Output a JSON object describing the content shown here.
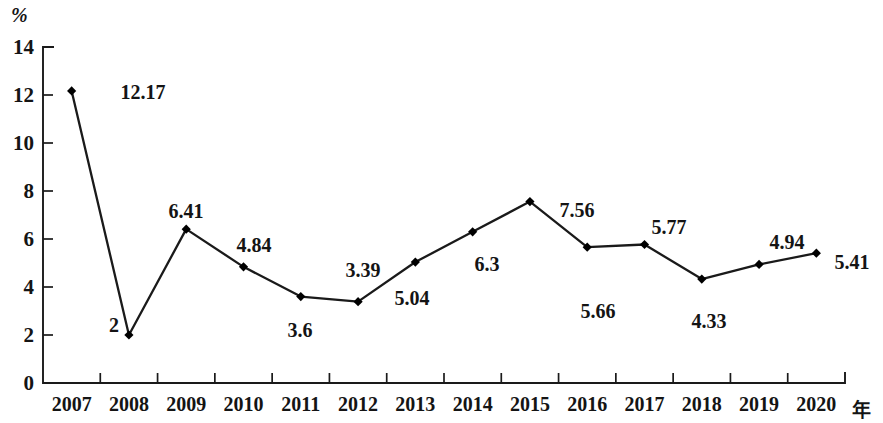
{
  "axes": {
    "y_unit_label": "%",
    "x_axis_name": "年",
    "y_ticks": [
      "0",
      "2",
      "4",
      "6",
      "8",
      "10",
      "12",
      "14"
    ],
    "x_ticks": [
      "2007",
      "2008",
      "2009",
      "2010",
      "2011",
      "2012",
      "2013",
      "2014",
      "2015",
      "2016",
      "2017",
      "2018",
      "2019",
      "2020"
    ]
  },
  "colors": {
    "line": "#1a1a1a",
    "marker": "#000000",
    "axis": "#1a1a1a",
    "text": "#141414",
    "background": "#ffffff"
  },
  "chart_data": {
    "type": "line",
    "title": "",
    "subtitle": "",
    "xlabel": "年",
    "ylabel": "%",
    "xlim": [
      "2007",
      "2020"
    ],
    "ylim": [
      0,
      14
    ],
    "ytick_step": 2,
    "grid": false,
    "legend": false,
    "marker": "diamond",
    "categories": [
      "2007",
      "2008",
      "2009",
      "2010",
      "2011",
      "2012",
      "2013",
      "2014",
      "2015",
      "2016",
      "2017",
      "2018",
      "2019",
      "2020"
    ],
    "values": [
      12.17,
      2,
      6.41,
      4.84,
      3.6,
      3.39,
      5.04,
      6.3,
      7.56,
      5.66,
      5.77,
      4.33,
      4.94,
      5.41
    ],
    "point_labels": [
      "12.17",
      "2",
      "6.41",
      "4.84",
      "3.6",
      "3.39",
      "5.04",
      "6.3",
      "7.56",
      "5.66",
      "5.77",
      "4.33",
      "4.94",
      "5.41"
    ],
    "label_positions": [
      {
        "text": "12.17",
        "x": 143,
        "y": 92
      },
      {
        "text": "2",
        "x": 114,
        "y": 325
      },
      {
        "text": "6.41",
        "x": 186,
        "y": 211
      },
      {
        "text": "4.84",
        "x": 254,
        "y": 245
      },
      {
        "text": "3.6",
        "x": 300,
        "y": 330
      },
      {
        "text": "3.39",
        "x": 363,
        "y": 270
      },
      {
        "text": "5.04",
        "x": 412,
        "y": 298
      },
      {
        "text": "6.3",
        "x": 487,
        "y": 264
      },
      {
        "text": "7.56",
        "x": 577,
        "y": 210
      },
      {
        "text": "5.66",
        "x": 598,
        "y": 311
      },
      {
        "text": "5.77",
        "x": 669,
        "y": 227
      },
      {
        "text": "4.33",
        "x": 709,
        "y": 321
      },
      {
        "text": "4.94",
        "x": 787,
        "y": 242
      },
      {
        "text": "5.41",
        "x": 852,
        "y": 262
      }
    ]
  }
}
